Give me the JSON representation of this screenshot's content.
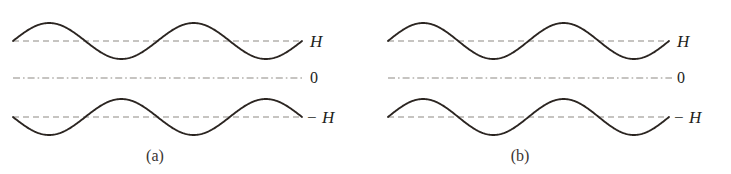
{
  "figure": {
    "background_color": "#ffffff",
    "wave_color": "#2b2521",
    "guide_color": "#8d8a84",
    "label_color": "#231f1c",
    "width": 731,
    "height": 174
  },
  "panels": [
    {
      "id": "a",
      "caption": "(a)",
      "caption_x": 155,
      "caption_y": 148,
      "origin_x": 0,
      "labels": [
        {
          "name": "h-label",
          "text": "H",
          "x": 310,
          "y": 33
        },
        {
          "name": "zero-label",
          "text": "0",
          "x": 310,
          "y": 70
        },
        {
          "name": "minus-h-label",
          "text": "− H",
          "x": 306,
          "y": 109
        }
      ],
      "guides": [
        {
          "name": "h-guide",
          "y": 41,
          "x1": 13,
          "x2": 302,
          "style": "dashed"
        },
        {
          "name": "zero-guide",
          "y": 78,
          "x1": 13,
          "x2": 305,
          "style": "dashdot"
        },
        {
          "name": "minus-h-guide",
          "y": 117,
          "x1": 13,
          "x2": 302,
          "style": "dashed"
        }
      ],
      "waves": [
        {
          "name": "upper-wave",
          "baseline": 41,
          "x1": 13,
          "x2": 302,
          "amplitude": 18,
          "periods": 2,
          "phase": "positive"
        },
        {
          "name": "lower-wave",
          "baseline": 117,
          "x1": 13,
          "x2": 302,
          "amplitude": 18,
          "periods": 2,
          "phase": "negative"
        }
      ]
    },
    {
      "id": "b",
      "caption": "(b)",
      "caption_x": 520,
      "caption_y": 148,
      "origin_x": 366,
      "labels": [
        {
          "name": "h-label",
          "text": "H",
          "x": 677,
          "y": 33
        },
        {
          "name": "zero-label",
          "text": "0",
          "x": 677,
          "y": 70
        },
        {
          "name": "minus-h-label",
          "text": "− H",
          "x": 673,
          "y": 109
        }
      ],
      "guides": [
        {
          "name": "h-guide",
          "y": 41,
          "x1": 388,
          "x2": 669,
          "style": "dashed"
        },
        {
          "name": "zero-guide",
          "y": 78,
          "x1": 388,
          "x2": 672,
          "style": "dashdot"
        },
        {
          "name": "minus-h-guide",
          "y": 117,
          "x1": 388,
          "x2": 669,
          "style": "dashed"
        }
      ],
      "waves": [
        {
          "name": "upper-wave",
          "baseline": 41,
          "x1": 388,
          "x2": 669,
          "amplitude": 18,
          "periods": 2,
          "phase": "positive"
        },
        {
          "name": "lower-wave",
          "baseline": 117,
          "x1": 388,
          "x2": 669,
          "amplitude": 18,
          "periods": 2,
          "phase": "positive"
        }
      ]
    }
  ],
  "chart_data": {
    "type": "line",
    "title": "",
    "xlabel": "",
    "ylabel": "",
    "grid": false,
    "legend": "none",
    "reference_levels": [
      {
        "label": "H",
        "value": 1
      },
      {
        "label": "0",
        "value": 0
      },
      {
        "label": "− H",
        "value": -1
      }
    ],
    "ylim": [
      -1.5,
      1.5
    ],
    "subplots": [
      {
        "caption": "(a)",
        "series": [
          {
            "name": "upper-wave",
            "offset_label": "H",
            "offset": 1,
            "amplitude": 0.35,
            "periods": 2,
            "phase_deg": 0
          },
          {
            "name": "lower-wave",
            "offset_label": "− H",
            "offset": -1,
            "amplitude": 0.35,
            "periods": 2,
            "phase_deg": 180
          }
        ]
      },
      {
        "caption": "(b)",
        "series": [
          {
            "name": "upper-wave",
            "offset_label": "H",
            "offset": 1,
            "amplitude": 0.35,
            "periods": 2,
            "phase_deg": 0
          },
          {
            "name": "lower-wave",
            "offset_label": "− H",
            "offset": -1,
            "amplitude": 0.35,
            "periods": 2,
            "phase_deg": 0
          }
        ]
      }
    ]
  }
}
